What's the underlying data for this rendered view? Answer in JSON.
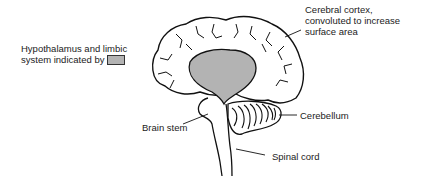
{
  "diagram": {
    "labels": {
      "cortex_line1": "Cerebral cortex,",
      "cortex_line2": "convoluted to increase",
      "cortex_line3": "surface area",
      "limbic_line1": "Hypothalamus and limbic",
      "limbic_line2": "system indicated by",
      "cerebellum": "Cerebellum",
      "brain_stem": "Brain stem",
      "spinal_cord": "Spinal cord"
    },
    "colors": {
      "limbic_fill": "#b3b3b3",
      "outline": "#111111"
    }
  }
}
